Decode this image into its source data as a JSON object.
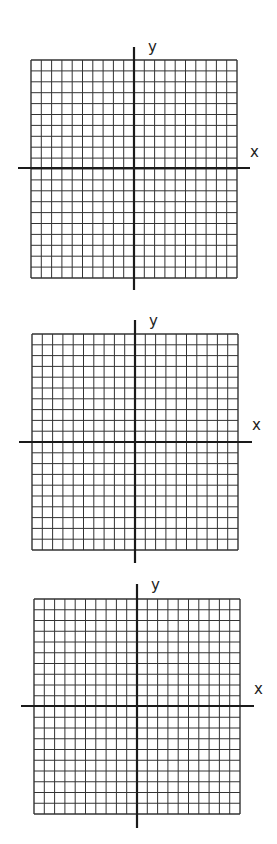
{
  "planes": [
    {
      "id": 1,
      "grid": {
        "left": 31,
        "top": 60,
        "right": 237,
        "bottom": 278,
        "cols": 20,
        "rows": 20
      },
      "x_axis": {
        "y": 168,
        "x1": 18,
        "x2": 250,
        "label": "x",
        "label_x": 250,
        "label_y": 157
      },
      "y_axis": {
        "x": 134,
        "y1": 47,
        "y2": 290,
        "label": "y",
        "label_x": 148,
        "label_y": 52
      }
    },
    {
      "id": 2,
      "grid": {
        "left": 32,
        "top": 334,
        "right": 238,
        "bottom": 550,
        "cols": 20,
        "rows": 20
      },
      "x_axis": {
        "y": 442,
        "x1": 19,
        "x2": 252,
        "label": "x",
        "label_x": 252,
        "label_y": 430
      },
      "y_axis": {
        "x": 135,
        "y1": 320,
        "y2": 563,
        "label": "y",
        "label_x": 149,
        "label_y": 326
      }
    },
    {
      "id": 3,
      "grid": {
        "left": 34,
        "top": 599,
        "right": 240,
        "bottom": 814,
        "cols": 20,
        "rows": 20
      },
      "x_axis": {
        "y": 706,
        "x1": 21,
        "x2": 254,
        "label": "x",
        "label_x": 254,
        "label_y": 694
      },
      "y_axis": {
        "x": 137,
        "y1": 584,
        "y2": 828,
        "label": "y",
        "label_x": 151,
        "label_y": 590
      }
    }
  ],
  "chart_data": [
    {
      "type": "scatter",
      "title": "",
      "xlabel": "x",
      "ylabel": "y",
      "grid": true,
      "grid_cells": [
        20,
        20
      ],
      "xlim": [
        -10,
        10
      ],
      "ylim": [
        -10,
        10
      ],
      "series": []
    },
    {
      "type": "scatter",
      "title": "",
      "xlabel": "x",
      "ylabel": "y",
      "grid": true,
      "grid_cells": [
        20,
        20
      ],
      "xlim": [
        -10,
        10
      ],
      "ylim": [
        -10,
        10
      ],
      "series": []
    },
    {
      "type": "scatter",
      "title": "",
      "xlabel": "x",
      "ylabel": "y",
      "grid": true,
      "grid_cells": [
        20,
        20
      ],
      "xlim": [
        -10,
        10
      ],
      "ylim": [
        -10,
        10
      ],
      "series": []
    }
  ],
  "colors": {
    "grid": "#333333",
    "axis": "#1a1a1a",
    "background": "#ffffff"
  }
}
